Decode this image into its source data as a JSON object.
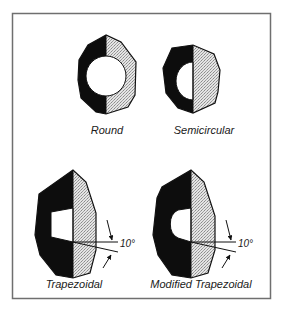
{
  "diagram": {
    "colors": {
      "frame": "#6f6f6f",
      "dark_fill": "#0d0d0d",
      "light_fill": "#d9d9d9",
      "outline": "#111111",
      "background": "#ffffff"
    },
    "shapes": [
      {
        "id": "round",
        "label": "Round"
      },
      {
        "id": "semicircular",
        "label": "Semicircular"
      },
      {
        "id": "trapezoidal",
        "label": "Trapezoidal",
        "angle_label": "10°"
      },
      {
        "id": "modified-trapezoidal",
        "label": "Modified Trapezoidal",
        "angle_label": "10°"
      }
    ]
  }
}
